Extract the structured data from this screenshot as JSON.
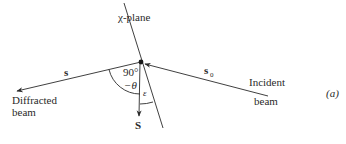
{
  "figure": {
    "panel_label": "(a)",
    "plane_label": "χ-plane",
    "vectors": {
      "diffracted": {
        "symbol": "s",
        "caption_line1": "Diffracted",
        "caption_line2": "beam"
      },
      "incident": {
        "symbol": "s",
        "subscript": "0",
        "caption_line1": "Incident",
        "caption_line2": "beam"
      },
      "scattering": {
        "symbol": "S"
      }
    },
    "angles": {
      "right_angle_label": "90°",
      "theta_label": "−θ",
      "epsilon_label": "ε"
    },
    "colors": {
      "line": "#2a2a2a",
      "background": "#ffffff"
    }
  }
}
